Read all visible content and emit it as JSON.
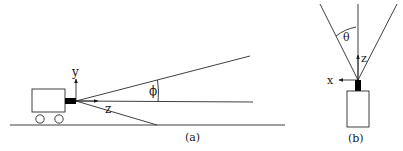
{
  "panel_a": {
    "caption": "(a)",
    "labels": {
      "y_axis": "y",
      "z_axis": "z",
      "angle": "ϕ"
    },
    "description": "Side view: cart with forward-facing camera; field of view bounded by upper and lower rays, with optical axis in the middle; vertical angle ϕ between upper ray and axis."
  },
  "panel_b": {
    "caption": "(b)",
    "labels": {
      "x_axis": "x",
      "z_axis": "z",
      "angle": "θ"
    },
    "description": "Top view: camera mounted on box; field of view bounded by left and right rays with vertical optical axis; horizontal angle θ between left ray and axis."
  },
  "colors": {
    "line": "#2a2a2a",
    "camera": "#000000",
    "background": "#ffffff"
  }
}
